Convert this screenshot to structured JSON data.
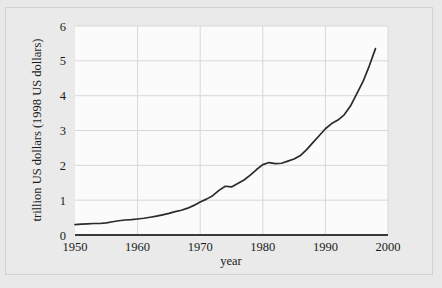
{
  "figure": {
    "background_color": "#e9e9e9",
    "plot_background_color": "#fbfbfb",
    "grid_color": "#d8d8d8",
    "line_color": "#2b2b2b",
    "axis_color": "#3a3a3a"
  },
  "chart_data": {
    "type": "line",
    "title": "",
    "xlabel": "year",
    "ylabel": "trillion US dollars (1998 US dollars)",
    "xlim": [
      1950,
      2000
    ],
    "ylim": [
      0,
      6
    ],
    "xticks": [
      1950,
      1960,
      1970,
      1980,
      1990,
      2000
    ],
    "xtick_labels": [
      "1950",
      "1960",
      "1970",
      "1980",
      "1990",
      "2000"
    ],
    "yticks": [
      0,
      1,
      2,
      3,
      4,
      5,
      6
    ],
    "ytick_labels": [
      "0",
      "1",
      "2",
      "3",
      "4",
      "5",
      "6"
    ],
    "grid": true,
    "legend": null,
    "series": [
      {
        "name": "gross world product",
        "x": [
          1950,
          1951,
          1952,
          1953,
          1954,
          1955,
          1956,
          1957,
          1958,
          1959,
          1960,
          1961,
          1962,
          1963,
          1964,
          1965,
          1966,
          1967,
          1968,
          1969,
          1970,
          1971,
          1972,
          1973,
          1974,
          1975,
          1976,
          1977,
          1978,
          1979,
          1980,
          1981,
          1982,
          1983,
          1984,
          1985,
          1986,
          1987,
          1988,
          1989,
          1990,
          1991,
          1992,
          1993,
          1994,
          1995,
          1996,
          1997,
          1998
        ],
        "values": [
          0.3,
          0.31,
          0.32,
          0.33,
          0.33,
          0.35,
          0.38,
          0.41,
          0.43,
          0.44,
          0.46,
          0.48,
          0.51,
          0.54,
          0.58,
          0.62,
          0.67,
          0.71,
          0.77,
          0.85,
          0.95,
          1.03,
          1.13,
          1.28,
          1.4,
          1.38,
          1.48,
          1.58,
          1.72,
          1.88,
          2.02,
          2.08,
          2.05,
          2.06,
          2.12,
          2.18,
          2.28,
          2.45,
          2.65,
          2.85,
          3.05,
          3.2,
          3.3,
          3.45,
          3.7,
          4.05,
          4.4,
          4.85,
          5.35
        ]
      }
    ]
  }
}
